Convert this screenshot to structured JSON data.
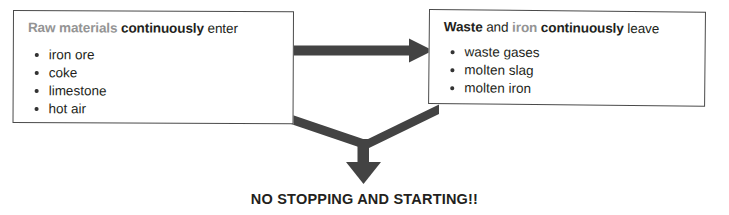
{
  "diagram": {
    "accent_color": "#434343",
    "grey_text_color": "#949494",
    "dark_text_color": "#231f20",
    "box_border_color": "#4a4a4a",
    "background_color": "#ffffff"
  },
  "left_box": {
    "name": "raw-materials-box",
    "heading": {
      "part_grey": "Raw materials",
      "part_bold": "continuously",
      "part_regular": "enter"
    },
    "items": [
      "iron ore",
      "coke",
      "limestone",
      "hot air"
    ]
  },
  "right_box": {
    "name": "waste-and-iron-box",
    "heading": {
      "part_bold_1": "Waste",
      "part_regular_1": "and",
      "part_grey": "iron",
      "part_bold_2": "continuously",
      "part_regular_2": "leave"
    },
    "items": [
      "waste gases",
      "molten slag",
      "molten iron"
    ]
  },
  "arrows": {
    "horizontal_arrow_label": "raw materials flow to waste and iron",
    "converging_arrow_label": "both processes converge downward"
  },
  "caption": {
    "text": "NO STOPPING AND STARTING!!"
  }
}
